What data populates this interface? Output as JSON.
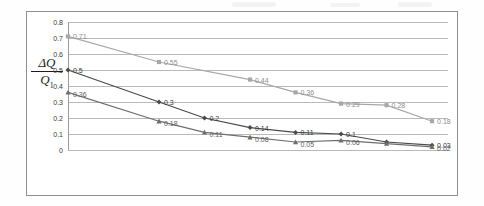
{
  "figure": {
    "y_axis_title_numerator": "ΔQ",
    "y_axis_title_denominator": "Q",
    "y_axis_title_denominator_sub": "1"
  },
  "chart_data": {
    "type": "line",
    "title": "",
    "xlabel": "",
    "ylabel": "ΔQ/Q1",
    "ylim": [
      0,
      0.8
    ],
    "yticks": [
      "0",
      "0.1",
      "0.2",
      "0.3",
      "0.4",
      "0.5",
      "0.6",
      "0.7",
      "0.8"
    ],
    "ytick_values": [
      0,
      0.1,
      0.2,
      0.3,
      0.4,
      0.5,
      0.6,
      0.7,
      0.8
    ],
    "grid": true,
    "xticks": [],
    "legend": [],
    "x": [
      1,
      2,
      3,
      4,
      5,
      6,
      7,
      8
    ],
    "series": [
      {
        "name": "series-square",
        "marker": "square",
        "color": "#a8a8a8",
        "x": [
          1,
          3,
          5,
          6,
          7,
          8,
          9
        ],
        "values": [
          0.71,
          0.55,
          0.44,
          0.36,
          0.29,
          0.28,
          0.18
        ],
        "labels": [
          "0.71",
          "0.55",
          "0.44",
          "0.36",
          "0.29",
          "0.28",
          "0.18"
        ]
      },
      {
        "name": "series-diamond",
        "marker": "diamond",
        "color": "#4a4a4a",
        "x": [
          1,
          3,
          4,
          5,
          6,
          7,
          8,
          9
        ],
        "values": [
          0.5,
          0.3,
          0.2,
          0.14,
          0.11,
          0.1,
          0.05,
          0.03
        ],
        "labels": [
          "0.5",
          "0.3",
          "0.2",
          "0.14",
          "0.11",
          "0.1",
          "",
          "0.03"
        ]
      },
      {
        "name": "series-triangle",
        "marker": "triangle",
        "color": "#6e6e6e",
        "x": [
          1,
          3,
          4,
          5,
          6,
          7,
          8,
          9
        ],
        "values": [
          0.36,
          0.18,
          0.11,
          0.08,
          0.05,
          0.06,
          0.04,
          0.02
        ],
        "labels": [
          "0.36",
          "0.18",
          "0.11",
          "0.08",
          "0.05",
          "0.06",
          "",
          "0.02"
        ]
      }
    ]
  }
}
